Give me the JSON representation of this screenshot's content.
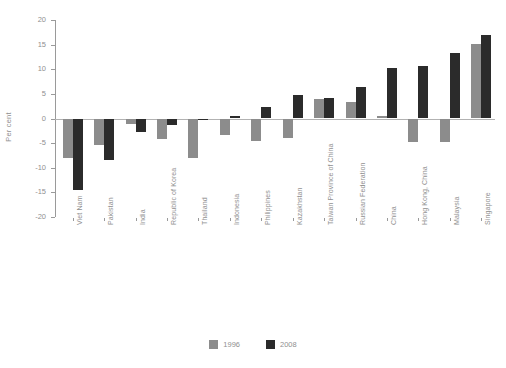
{
  "chart_data": {
    "type": "bar",
    "title": "",
    "subtitle": "",
    "xlabel": "",
    "ylabel": "Per cent",
    "ylim": [
      -20,
      20
    ],
    "yticks": [
      20,
      15,
      10,
      5,
      0,
      -5,
      -10,
      -15,
      -20
    ],
    "ytick_labels": [
      "20",
      "15",
      "10",
      "5",
      "0",
      "-5",
      "-10",
      "-15",
      "-20"
    ],
    "grid": false,
    "legend_position": "bottom",
    "categories": [
      "Viet Nam",
      "Pakistan",
      "India",
      "Republic of Korea",
      "Thailand",
      "Indonesia",
      "Philippines",
      "Kazakhstan",
      "Taiwan Province of China",
      "Russian Federation",
      "China",
      "Hong Kong, China",
      "Malaysia",
      "Singapore"
    ],
    "series": [
      {
        "name": "1996",
        "color": "#8c8c8c",
        "values": [
          -8.1,
          -5.4,
          -1.2,
          -4.1,
          -8.0,
          -3.3,
          -4.6,
          -4.0,
          4.0,
          3.3,
          0.6,
          -4.8,
          -4.8,
          15.2
        ]
      },
      {
        "name": "2008",
        "color": "#2b2b2b",
        "values": [
          -14.5,
          -8.4,
          -2.7,
          -1.3,
          -0.2,
          0.6,
          2.3,
          4.7,
          4.2,
          6.3,
          10.2,
          10.6,
          13.3,
          17.0
        ]
      }
    ]
  },
  "legend": {
    "items": [
      {
        "label": "1996",
        "color": "#8c8c8c"
      },
      {
        "label": "2008",
        "color": "#2b2b2b"
      }
    ]
  },
  "axis": {
    "y_title": "Per cent"
  }
}
